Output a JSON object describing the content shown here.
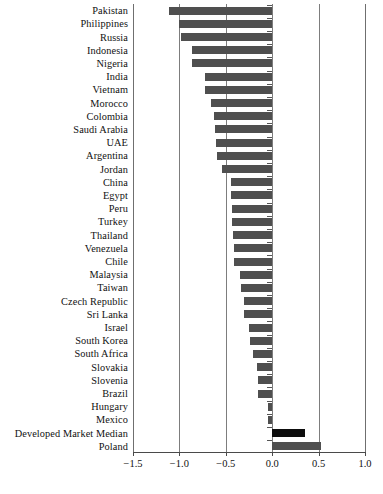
{
  "chart_data": {
    "type": "bar",
    "orientation": "horizontal",
    "title": "",
    "subtitle": "",
    "xlabel": "",
    "ylabel": "",
    "xlim": [
      -1.5,
      1.0
    ],
    "xticks": [
      -1.5,
      -1.0,
      -0.5,
      0.0,
      0.5,
      1.0
    ],
    "xtick_labels": [
      "−1.5",
      "−1.0",
      "−0.5",
      "0.0",
      "0.5",
      "1.0"
    ],
    "grid": "vertical",
    "legend": "none",
    "bar_color": "#4f4f4f",
    "highlight_color": "#0d0d0d",
    "highlight_category": "Developed Market Median",
    "categories": [
      "Pakistan",
      "Philippines",
      "Russia",
      "Indonesia",
      "Nigeria",
      "India",
      "Vietnam",
      "Morocco",
      "Colombia",
      "Saudi Arabia",
      "UAE",
      "Argentina",
      "Jordan",
      "China",
      "Egypt",
      "Peru",
      "Turkey",
      "Thailand",
      "Venezuela",
      "Chile",
      "Malaysia",
      "Taiwan",
      "Czech Republic",
      "Sri Lanka",
      "Israel",
      "South Korea",
      "South Africa",
      "Slovakia",
      "Slovenia",
      "Brazil",
      "Hungary",
      "Mexico",
      "Developed Market Median",
      "Poland"
    ],
    "values": [
      -1.11,
      -1.0,
      -0.98,
      -0.86,
      -0.86,
      -0.72,
      -0.72,
      -0.66,
      -0.63,
      -0.62,
      -0.61,
      -0.59,
      -0.54,
      -0.44,
      -0.44,
      -0.43,
      -0.43,
      -0.42,
      -0.41,
      -0.41,
      -0.35,
      -0.34,
      -0.3,
      -0.3,
      -0.25,
      -0.24,
      -0.21,
      -0.16,
      -0.15,
      -0.15,
      -0.05,
      -0.04,
      0.35,
      0.53
    ]
  }
}
